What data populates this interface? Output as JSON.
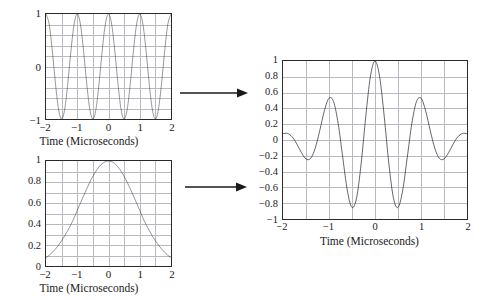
{
  "figure": {
    "name": "gaussian-modulated-pulse-construction",
    "background": "#ffffff",
    "curve_color": "#111111",
    "grid_color": "#b9b9c4",
    "frame_color": "#2a2a2a"
  },
  "arrows": [
    {
      "name": "arrow-carrier-to-product",
      "direction": "right",
      "glyph": "→"
    },
    {
      "name": "arrow-envelope-to-product",
      "direction": "right",
      "glyph": "→"
    }
  ],
  "chart_data": [
    {
      "id": "carrier",
      "type": "line",
      "title": "",
      "xlabel": "Time (Microseconds)",
      "ylabel": "",
      "xlim": [
        -2,
        2
      ],
      "ylim": [
        -1,
        1
      ],
      "xticks": [
        -2,
        -1,
        0,
        1,
        2
      ],
      "xtick_labels": [
        "−2",
        "−1",
        "0",
        "1",
        "2"
      ],
      "yticks": [
        -1,
        0,
        1
      ],
      "ytick_labels": [
        "−1",
        "0",
        "1"
      ],
      "grid": true,
      "grid_x": [
        -2,
        -1.5,
        -1,
        -0.5,
        0,
        0.5,
        1,
        1.5,
        2
      ],
      "grid_y": [
        -1,
        -0.8,
        -0.6,
        -0.4,
        -0.2,
        0,
        0.2,
        0.4,
        0.6,
        0.8,
        1
      ],
      "legend": null,
      "description": "Cosine carrier, amplitude 1, frequency 1 MHz (4 cycles over 4 microseconds)",
      "formula": "y = cos(2*pi*t)",
      "x": [
        -2,
        -1.9,
        -1.8,
        -1.7,
        -1.6,
        -1.5,
        -1.4,
        -1.3,
        -1.2,
        -1.1,
        -1,
        -0.9,
        -0.8,
        -0.7,
        -0.6,
        -0.5,
        -0.4,
        -0.3,
        -0.2,
        -0.1,
        0,
        0.1,
        0.2,
        0.3,
        0.4,
        0.5,
        0.6,
        0.7,
        0.8,
        0.9,
        1,
        1.1,
        1.2,
        1.3,
        1.4,
        1.5,
        1.6,
        1.7,
        1.8,
        1.9,
        2
      ],
      "values": [
        1,
        0.809,
        0.309,
        -0.309,
        -0.809,
        -1,
        -0.809,
        -0.309,
        0.309,
        0.809,
        1,
        0.809,
        0.309,
        -0.309,
        -0.809,
        -1,
        -0.809,
        -0.309,
        0.309,
        0.809,
        1,
        0.809,
        0.309,
        -0.309,
        -0.809,
        -1,
        -0.809,
        -0.309,
        0.309,
        0.809,
        1,
        0.809,
        0.309,
        -0.309,
        -0.809,
        -1,
        -0.809,
        -0.309,
        0.309,
        0.809,
        1
      ]
    },
    {
      "id": "envelope",
      "type": "line",
      "title": "",
      "xlabel": "Time (Microseconds)",
      "ylabel": "",
      "xlim": [
        -2,
        2
      ],
      "ylim": [
        0,
        1
      ],
      "xticks": [
        -2,
        -1,
        0,
        1,
        2
      ],
      "xtick_labels": [
        "−2",
        "−1",
        "0",
        "1",
        "2"
      ],
      "yticks": [
        0,
        0.2,
        0.4,
        0.6,
        0.8,
        1
      ],
      "ytick_labels": [
        "0",
        "0.2",
        "0.4",
        "0.6",
        "0.8",
        "1"
      ],
      "grid": true,
      "grid_x": [
        -2,
        -1.5,
        -1,
        -0.5,
        0,
        0.5,
        1,
        1.5,
        2
      ],
      "grid_y": [
        0,
        0.1,
        0.2,
        0.3,
        0.4,
        0.5,
        0.6,
        0.7,
        0.8,
        0.9,
        1
      ],
      "legend": null,
      "description": "Gaussian envelope peaking at 1 at t = 0, decaying to about 0.08 at t = +/-2",
      "formula": "y = exp(-t^2 / 1.58)",
      "x": [
        -2,
        -1.9,
        -1.8,
        -1.7,
        -1.6,
        -1.5,
        -1.4,
        -1.3,
        -1.2,
        -1.1,
        -1,
        -0.9,
        -0.8,
        -0.7,
        -0.6,
        -0.5,
        -0.4,
        -0.3,
        -0.2,
        -0.1,
        0,
        0.1,
        0.2,
        0.3,
        0.4,
        0.5,
        0.6,
        0.7,
        0.8,
        0.9,
        1,
        1.1,
        1.2,
        1.3,
        1.4,
        1.5,
        1.6,
        1.7,
        1.8,
        1.9,
        2
      ],
      "values": [
        0.08,
        0.102,
        0.129,
        0.161,
        0.198,
        0.24,
        0.288,
        0.34,
        0.396,
        0.458,
        0.53,
        0.598,
        0.667,
        0.733,
        0.796,
        0.854,
        0.904,
        0.945,
        0.975,
        0.994,
        1,
        0.994,
        0.975,
        0.945,
        0.904,
        0.854,
        0.796,
        0.733,
        0.667,
        0.598,
        0.53,
        0.458,
        0.396,
        0.34,
        0.288,
        0.24,
        0.198,
        0.161,
        0.129,
        0.102,
        0.08
      ]
    },
    {
      "id": "product",
      "type": "line",
      "title": "",
      "xlabel": "Time (Microseconds)",
      "ylabel": "",
      "xlim": [
        -2,
        2
      ],
      "ylim": [
        -1,
        1
      ],
      "xticks": [
        -2,
        -1,
        0,
        1,
        2
      ],
      "xtick_labels": [
        "−2",
        "−1",
        "0",
        "1",
        "2"
      ],
      "yticks": [
        -1,
        -0.8,
        -0.6,
        -0.4,
        -0.2,
        0,
        0.2,
        0.4,
        0.6,
        0.8,
        1
      ],
      "ytick_labels": [
        "−1",
        "−0.8",
        "−0.6",
        "−0.4",
        "−0.2",
        "0",
        "0.2",
        "0.4",
        "0.6",
        "0.8",
        "1"
      ],
      "grid": true,
      "grid_x": [
        -2,
        -1.5,
        -1,
        -0.5,
        0,
        0.5,
        1,
        1.5,
        2
      ],
      "grid_y": [
        -1,
        -0.8,
        -0.6,
        -0.4,
        -0.2,
        0,
        0.2,
        0.4,
        0.6,
        0.8,
        1
      ],
      "legend": null,
      "description": "Gaussian-modulated cosine pulse: product of the carrier and the envelope. Central peak about 0.97 at t=0, negative troughs about -0.9 at t=+/-0.5, side peaks about 0.52 at t=+/-1.",
      "formula": "y = exp(-t^2 / 1.58) * cos(2*pi*t)",
      "key_points": [
        {
          "t": 0,
          "y": 0.97
        },
        {
          "t": -0.5,
          "y": -0.9
        },
        {
          "t": 0.5,
          "y": -0.9
        },
        {
          "t": -1,
          "y": 0.53
        },
        {
          "t": 1,
          "y": 0.5
        },
        {
          "t": -1.5,
          "y": -0.24
        },
        {
          "t": 1.5,
          "y": -0.26
        },
        {
          "t": -2,
          "y": 0.08
        },
        {
          "t": 2,
          "y": 0.03
        }
      ],
      "x": [
        -2,
        -1.9,
        -1.8,
        -1.7,
        -1.6,
        -1.5,
        -1.4,
        -1.3,
        -1.2,
        -1.1,
        -1,
        -0.9,
        -0.8,
        -0.7,
        -0.6,
        -0.5,
        -0.4,
        -0.3,
        -0.2,
        -0.1,
        0,
        0.1,
        0.2,
        0.3,
        0.4,
        0.5,
        0.6,
        0.7,
        0.8,
        0.9,
        1,
        1.1,
        1.2,
        1.3,
        1.4,
        1.5,
        1.6,
        1.7,
        1.8,
        1.9,
        2
      ],
      "values": [
        0.08,
        0.083,
        0.04,
        -0.05,
        -0.16,
        -0.24,
        -0.233,
        -0.105,
        0.122,
        0.371,
        0.53,
        0.484,
        0.206,
        -0.226,
        -0.644,
        -0.854,
        -0.731,
        -0.292,
        0.301,
        0.804,
        1,
        0.804,
        0.301,
        -0.292,
        -0.731,
        -0.854,
        -0.644,
        -0.226,
        0.206,
        0.484,
        0.53,
        0.371,
        0.122,
        -0.105,
        -0.233,
        -0.24,
        -0.16,
        -0.05,
        0.04,
        0.083,
        0.08
      ]
    }
  ]
}
